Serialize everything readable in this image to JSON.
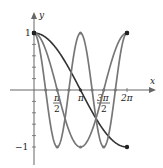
{
  "chart_data": {
    "type": "line",
    "title": "",
    "xlabel": "x",
    "ylabel": "y",
    "xlim": [
      0,
      6.2832
    ],
    "ylim": [
      -1,
      1
    ],
    "grid": false,
    "legend": null,
    "x_ticks": [
      {
        "value": 1.5708,
        "label_num": "π",
        "label_den": "2"
      },
      {
        "value": 3.1416,
        "label": "π"
      },
      {
        "value": 4.7124,
        "label_num": "3π",
        "label_den": "2"
      },
      {
        "value": 6.2832,
        "label": "2π"
      }
    ],
    "y_ticks": [
      {
        "value": 1,
        "label": "1"
      },
      {
        "value": -1,
        "label": "−1"
      }
    ],
    "series": [
      {
        "name": "cos(x/2)",
        "k": 0.5,
        "color": "#333333",
        "marked_points": [
          [
            0,
            1
          ],
          [
            3.1416,
            0
          ],
          [
            6.2832,
            -1
          ]
        ]
      },
      {
        "name": "cos(x)",
        "k": 1,
        "color": "#777777",
        "marked_points": [
          [
            0,
            1
          ],
          [
            1.5708,
            0
          ],
          [
            3.1416,
            -1
          ],
          [
            4.7124,
            0
          ],
          [
            6.2832,
            1
          ]
        ]
      },
      {
        "name": "cos(2x)",
        "k": 2,
        "color": "#777777",
        "marked_points": [
          [
            0,
            1
          ],
          [
            0.7854,
            0
          ],
          [
            1.5708,
            -1
          ],
          [
            2.3562,
            0
          ],
          [
            3.1416,
            1
          ],
          [
            3.927,
            0
          ],
          [
            4.7124,
            -1
          ],
          [
            5.4978,
            0
          ],
          [
            6.2832,
            1
          ]
        ]
      }
    ]
  },
  "labels": {
    "x_axis": "x",
    "y_axis": "y",
    "y_one": "1",
    "y_neg_one": "−1",
    "pi": "π",
    "two": "2",
    "three_pi": "3π",
    "two_pi": "2π"
  }
}
